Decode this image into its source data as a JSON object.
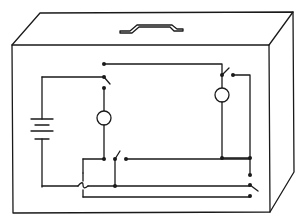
{
  "diagram": {
    "title": "",
    "colors": {
      "stroke": "#1a1a1a",
      "background": "#ffffff"
    },
    "components": [
      {
        "id": "box",
        "type": "enclosure",
        "label": ""
      },
      {
        "id": "handle",
        "type": "carry-handle",
        "label": ""
      },
      {
        "id": "battery",
        "type": "battery",
        "label": ""
      },
      {
        "id": "lamp-left",
        "type": "lamp",
        "label": ""
      },
      {
        "id": "lamp-right",
        "type": "lamp",
        "label": ""
      },
      {
        "id": "switch-top-left",
        "type": "switch",
        "state": "open",
        "label": ""
      },
      {
        "id": "switch-top-right",
        "type": "switch",
        "state": "open",
        "label": ""
      },
      {
        "id": "switch-bottom-middle",
        "type": "switch",
        "state": "open",
        "label": ""
      },
      {
        "id": "switch-bottom-right",
        "type": "switch",
        "state": "open",
        "label": ""
      }
    ],
    "labels": []
  }
}
